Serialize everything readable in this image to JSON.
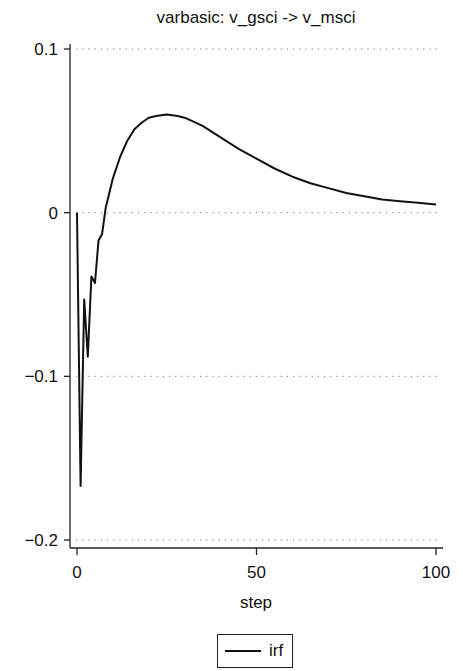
{
  "chart_data": {
    "type": "line",
    "title": "varbasic: v_gsci -> v_msci",
    "xlabel": "step",
    "ylabel": "",
    "xlim": [
      0,
      100
    ],
    "ylim": [
      -0.2,
      0.1
    ],
    "xticks": [
      0,
      50,
      100
    ],
    "xtick_labels": [
      "0",
      "50",
      "100"
    ],
    "yticks": [
      0.1,
      0,
      -0.1,
      -0.2
    ],
    "ytick_labels": [
      "0.1",
      "0",
      "-0.1",
      "-0.2"
    ],
    "grid": "horizontal dotted at y ticks",
    "legend_position": "bottom-center",
    "series": [
      {
        "name": "irf",
        "color": "#111111",
        "x": [
          0,
          1,
          2,
          3,
          4,
          5,
          6,
          7,
          8,
          9,
          10,
          12,
          14,
          16,
          18,
          20,
          22,
          25,
          28,
          30,
          35,
          40,
          45,
          50,
          55,
          60,
          65,
          70,
          75,
          80,
          85,
          90,
          95,
          100
        ],
        "values": [
          0.0,
          -0.167,
          -0.053,
          -0.088,
          -0.039,
          -0.043,
          -0.017,
          -0.013,
          0.003,
          0.012,
          0.021,
          0.034,
          0.044,
          0.051,
          0.055,
          0.058,
          0.059,
          0.06,
          0.059,
          0.058,
          0.053,
          0.046,
          0.039,
          0.033,
          0.027,
          0.022,
          0.018,
          0.015,
          0.012,
          0.01,
          0.008,
          0.007,
          0.006,
          0.005
        ]
      }
    ]
  },
  "legend": {
    "items": [
      {
        "label": "irf"
      }
    ]
  }
}
